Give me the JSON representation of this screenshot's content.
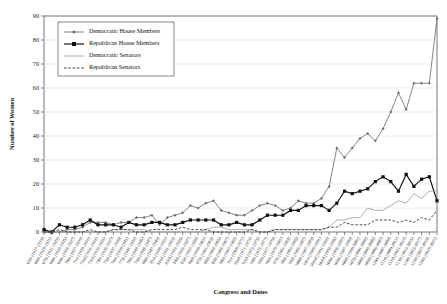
{
  "chart_data": {
    "type": "line",
    "title": "",
    "xlabel": "Congress and Dates",
    "ylabel": "Number of Women",
    "ylim": [
      0,
      90
    ],
    "ytick_step": 10,
    "yticks": [
      0,
      10,
      20,
      30,
      40,
      50,
      60,
      70,
      80,
      90
    ],
    "grid": true,
    "legend_position": "top-left",
    "categories": [
      "65th (1917-1919)",
      "66th (1919-1921)",
      "67th (1921-1923)",
      "68th (1923-1925)",
      "69th (1925-1927)",
      "70th (1927-1929)",
      "71st (1929-1931)",
      "72nd (1931-1933)",
      "73rd (1933-1935)",
      "74th (1935-1937)",
      "75th (1937-1939)",
      "76th (1939-1941)",
      "77th (1941-1943)",
      "78th (1943-1945)",
      "79th (1945-1947)",
      "80th (1947-1949)",
      "81st (1949-1951)",
      "82nd (1951-1953)",
      "83rd (1953-1955)",
      "84th (1955-1957)",
      "85th (1957-1959)",
      "86th (1959-1961)",
      "87th (1961-1963)",
      "88th (1963-1965)",
      "89th (1965-1967)",
      "90th (1967-1969)",
      "91st (1969-1971)",
      "92nd (1971-1973)",
      "93rd (1973-1975)",
      "94th (1975-1977)",
      "95th (1977-1979)",
      "96th (1979-1981)",
      "97th (1981-1983)",
      "98th (1983-1985)",
      "99th (1985-1987)",
      "100th (1987-1989)",
      "101st (1989-1991)",
      "102nd (1991-1993)",
      "103rd (1993-1995)",
      "104th (1995-1997)",
      "105th (1997-1999)",
      "106th (1999-2001)",
      "107th (2001-2003)",
      "108th (2003-2005)",
      "109th (2005-2007)",
      "110th (2007-2009)",
      "111th (2009-2011)",
      "112th (2011-2013)",
      "113th (2013-2015)",
      "114th (2015-2017)",
      "115th (2017-2019)",
      "116th (2019-2021)"
    ],
    "series": [
      {
        "name": "Democratic House Members",
        "marker": "diamond",
        "color": "#6e6e6e",
        "values": [
          0,
          0,
          0,
          1,
          1,
          2,
          4,
          4,
          4,
          3,
          4,
          4,
          6,
          6,
          7,
          3,
          6,
          7,
          8,
          11,
          10,
          12,
          13,
          9,
          8,
          7,
          7,
          9,
          11,
          12,
          11,
          9,
          10,
          13,
          12,
          12,
          14,
          19,
          35,
          31,
          35,
          39,
          41,
          38,
          43,
          50,
          58,
          51,
          62,
          62,
          62,
          89
        ]
      },
      {
        "name": "Republican House Members",
        "marker": "square",
        "color": "#111111",
        "values": [
          1,
          0,
          3,
          2,
          2,
          3,
          5,
          3,
          3,
          3,
          2,
          4,
          3,
          3,
          4,
          4,
          3,
          3,
          4,
          5,
          5,
          5,
          5,
          3,
          3,
          4,
          3,
          3,
          5,
          7,
          7,
          7,
          9,
          9,
          11,
          11,
          11,
          9,
          12,
          17,
          16,
          17,
          18,
          21,
          23,
          21,
          17,
          24,
          19,
          22,
          23,
          13
        ]
      },
      {
        "name": "Democratic Senators",
        "marker": "none",
        "color": "#9a9a9a",
        "values": [
          0,
          0,
          0,
          0,
          0,
          0,
          0,
          0,
          0,
          1,
          1,
          1,
          1,
          1,
          0,
          0,
          0,
          0,
          0,
          0,
          0,
          1,
          2,
          2,
          1,
          1,
          1,
          1,
          0,
          0,
          1,
          1,
          1,
          1,
          1,
          1,
          1,
          2,
          5,
          5,
          6,
          6,
          10,
          9,
          9,
          11,
          13,
          12,
          16,
          14,
          17,
          17
        ]
      },
      {
        "name": "Republican Senators",
        "marker": "none",
        "color": "#2b2b2b",
        "values": [
          0,
          0,
          1,
          0,
          0,
          0,
          1,
          0,
          0,
          1,
          1,
          1,
          0,
          0,
          1,
          1,
          1,
          1,
          2,
          1,
          1,
          1,
          0,
          0,
          0,
          0,
          0,
          1,
          0,
          0,
          1,
          1,
          1,
          1,
          1,
          1,
          1,
          2,
          2,
          4,
          3,
          3,
          3,
          5,
          5,
          5,
          4,
          5,
          4,
          6,
          5,
          9
        ]
      }
    ]
  },
  "legend": {
    "items": [
      {
        "label": "Democratic House Members",
        "style": "line-diamond-gray"
      },
      {
        "label": "Republican House Members",
        "style": "line-square-black"
      },
      {
        "label": "Democratic Senators",
        "style": "line-plain-gray"
      },
      {
        "label": "Republican Senators",
        "style": "line-dashed-black"
      }
    ]
  }
}
